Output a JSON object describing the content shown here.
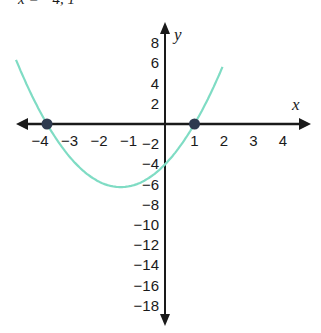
{
  "chart_data": {
    "type": "line",
    "title": "",
    "xlabel": "x",
    "ylabel": "y",
    "function": "y = x^2 + 3x - 4",
    "xlim": [
      -5.5,
      5.2
    ],
    "ylim": [
      -19.5,
      9.5
    ],
    "x_ticks": [
      "-4",
      "-3",
      "-2",
      "-1",
      "1",
      "2",
      "3",
      "4"
    ],
    "y_ticks": [
      "8",
      "6",
      "4",
      "2",
      "-2",
      "-4",
      "-6",
      "-8",
      "-10",
      "-12",
      "-14",
      "-16",
      "-18"
    ],
    "series": [
      {
        "name": "parabola",
        "color": "#7fdcc4",
        "x": [
          -5.0,
          -4.5,
          -4.0,
          -3.5,
          -3.0,
          -2.5,
          -2.0,
          -1.5,
          -1.0,
          -0.5,
          0.0,
          0.5,
          1.0,
          1.5,
          2.0
        ],
        "y": [
          6.0,
          2.75,
          0.0,
          -2.25,
          -4.0,
          -5.25,
          -6.0,
          -6.25,
          -6.0,
          -5.25,
          -4.0,
          -2.25,
          0.0,
          2.75,
          6.0
        ]
      }
    ],
    "points": [
      {
        "label": "x-intercept",
        "x": -4,
        "y": 0,
        "color": "#2e3a4f"
      },
      {
        "label": "x-intercept",
        "x": 1,
        "y": 0,
        "color": "#2e3a4f"
      }
    ],
    "annotations": {
      "y_intercept": -8,
      "vertex": [
        -1.5,
        -12.25
      ]
    },
    "grid": false
  },
  "header": {
    "cut_text": "x = −4, 1"
  },
  "axes": {
    "x_label": "x",
    "y_label": "y"
  }
}
